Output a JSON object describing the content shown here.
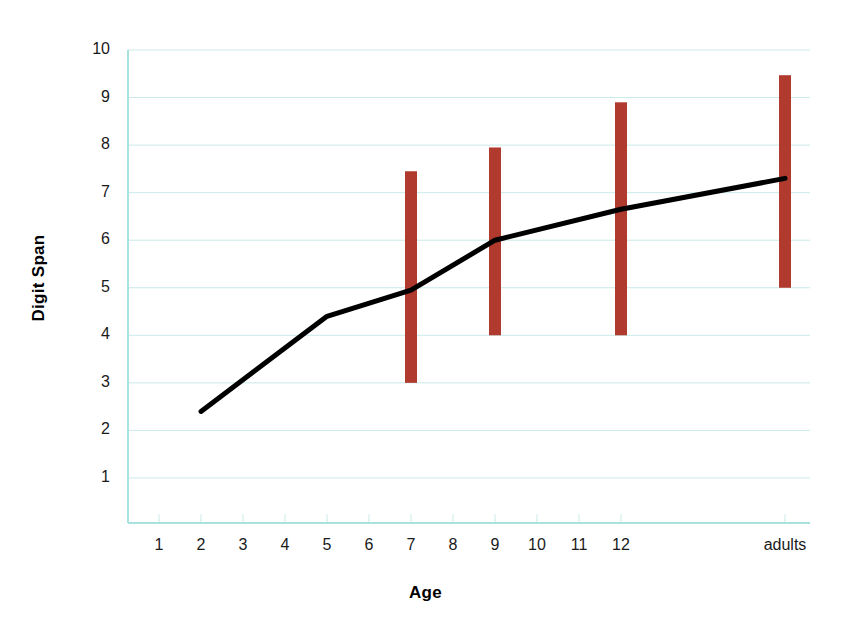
{
  "chart_data": {
    "type": "line",
    "title": "",
    "xlabel": "Age",
    "ylabel": "Digit Span",
    "grid": true,
    "legend": "none",
    "x_tick_labels": [
      "1",
      "2",
      "3",
      "4",
      "5",
      "6",
      "7",
      "8",
      "9",
      "10",
      "11",
      "12",
      "adults"
    ],
    "y_tick_labels": [
      "1",
      "2",
      "3",
      "4",
      "5",
      "6",
      "7",
      "8",
      "9",
      "10"
    ],
    "ylim": [
      0,
      10
    ],
    "series": [
      {
        "name": "Digit Span",
        "color": "#000000",
        "points": [
          {
            "x": "2",
            "y": 2.4
          },
          {
            "x": "5",
            "y": 4.4
          },
          {
            "x": "7",
            "y": 4.95
          },
          {
            "x": "9",
            "y": 6.0
          },
          {
            "x": "12",
            "y": 6.65
          },
          {
            "x": "adults",
            "y": 7.3
          }
        ]
      }
    ],
    "ranges": {
      "name": "Range",
      "color": "#b03a2e",
      "bars": [
        {
          "x": "7",
          "low": 3.0,
          "high": 7.45
        },
        {
          "x": "9",
          "low": 4.0,
          "high": 7.95
        },
        {
          "x": "12",
          "low": 4.0,
          "high": 8.9
        },
        {
          "x": "adults",
          "low": 5.0,
          "high": 9.47
        }
      ]
    },
    "colors": {
      "line": "#000000",
      "range_bar": "#b03a2e",
      "gridline": "#c9eae8",
      "axis": "#a8e2de",
      "background": "#ffffff"
    }
  }
}
